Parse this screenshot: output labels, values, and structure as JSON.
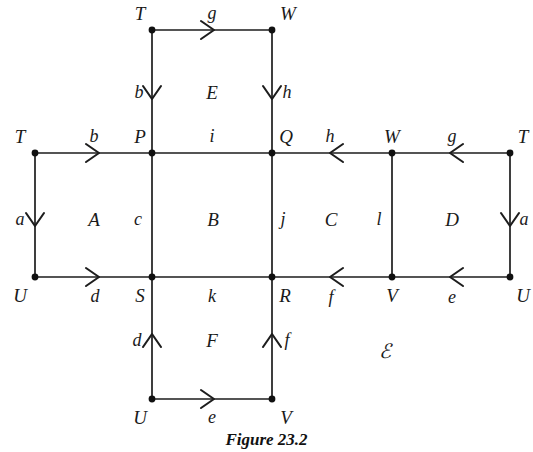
{
  "figure": {
    "caption": "Figure 23.2",
    "complex_label": "ℬ",
    "complex_label_display": "ℰ",
    "space_symbol": "X"
  },
  "style": {
    "line_color": "#1d1d1d",
    "node_color": "#111111",
    "text_color": "#1a1a1a",
    "background": "#ffffff"
  },
  "chart_data": {
    "type": "diagram",
    "title": "Figure 23.2",
    "vertices": [
      {
        "id": "v_T_top",
        "label": "T",
        "x": 152,
        "y": 30,
        "label_x": 140,
        "label_y": 13
      },
      {
        "id": "v_W_top",
        "label": "W",
        "x": 272,
        "y": 30,
        "label_x": 288,
        "label_y": 13
      },
      {
        "id": "v_T_left",
        "label": "T",
        "x": 35,
        "y": 153,
        "label_x": 20,
        "label_y": 136
      },
      {
        "id": "v_P",
        "label": "P",
        "x": 152,
        "y": 153,
        "label_x": 140,
        "label_y": 136
      },
      {
        "id": "v_Q",
        "label": "Q",
        "x": 272,
        "y": 153,
        "label_x": 286,
        "label_y": 136
      },
      {
        "id": "v_W_right",
        "label": "W",
        "x": 392,
        "y": 153,
        "label_x": 392,
        "label_y": 136
      },
      {
        "id": "v_T_right",
        "label": "T",
        "x": 510,
        "y": 153,
        "label_x": 523,
        "label_y": 136
      },
      {
        "id": "v_U_left",
        "label": "U",
        "x": 35,
        "y": 277,
        "label_x": 20,
        "label_y": 295
      },
      {
        "id": "v_S",
        "label": "S",
        "x": 152,
        "y": 277,
        "label_x": 140,
        "label_y": 295
      },
      {
        "id": "v_R",
        "label": "R",
        "x": 272,
        "y": 277,
        "label_x": 285,
        "label_y": 295
      },
      {
        "id": "v_V_right",
        "label": "V",
        "x": 392,
        "y": 277,
        "label_x": 392,
        "label_y": 295
      },
      {
        "id": "v_U_right",
        "label": "U",
        "x": 510,
        "y": 277,
        "label_x": 523,
        "label_y": 295
      },
      {
        "id": "v_U_bot",
        "label": "U",
        "x": 152,
        "y": 399,
        "label_x": 140,
        "label_y": 417
      },
      {
        "id": "v_V_bot",
        "label": "V",
        "x": 272,
        "y": 399,
        "label_x": 286,
        "label_y": 417
      }
    ],
    "edges": [
      {
        "id": "e_g_top",
        "label": "g",
        "from": "v_T_top",
        "to": "v_W_top",
        "direction": "right",
        "arrow": true,
        "label_x": 212,
        "label_y": 13,
        "arrow_x": 212,
        "arrow_y": 30
      },
      {
        "id": "e_b_top",
        "label": "b",
        "from": "v_T_top",
        "to": "v_P",
        "direction": "down",
        "arrow": true,
        "label_x": 139,
        "label_y": 92,
        "arrow_x": 152,
        "arrow_y": 97
      },
      {
        "id": "e_h_top",
        "label": "h",
        "from": "v_W_top",
        "to": "v_Q",
        "direction": "down",
        "arrow": true,
        "label_x": 287,
        "label_y": 92,
        "arrow_x": 272,
        "arrow_y": 97
      },
      {
        "id": "e_b_mid",
        "label": "b",
        "from": "v_T_left",
        "to": "v_P",
        "direction": "right",
        "arrow": true,
        "label_x": 94,
        "label_y": 136,
        "arrow_x": 97,
        "arrow_y": 153
      },
      {
        "id": "e_i",
        "label": "i",
        "from": "v_P",
        "to": "v_Q",
        "direction": "none",
        "arrow": false,
        "label_x": 212,
        "label_y": 136
      },
      {
        "id": "e_h_mid",
        "label": "h",
        "from": "v_W_right",
        "to": "v_Q",
        "direction": "left",
        "arrow": true,
        "label_x": 330,
        "label_y": 136,
        "arrow_x": 332,
        "arrow_y": 153
      },
      {
        "id": "e_g_mid",
        "label": "g",
        "from": "v_T_right",
        "to": "v_W_right",
        "direction": "left",
        "arrow": true,
        "label_x": 452,
        "label_y": 136,
        "arrow_x": 452,
        "arrow_y": 153
      },
      {
        "id": "e_a_left",
        "label": "a",
        "from": "v_T_left",
        "to": "v_U_left",
        "direction": "down",
        "arrow": true,
        "label_x": 20,
        "label_y": 219,
        "arrow_x": 35,
        "arrow_y": 224
      },
      {
        "id": "e_c",
        "label": "c",
        "from": "v_P",
        "to": "v_S",
        "direction": "none",
        "arrow": false,
        "label_x": 138,
        "label_y": 219
      },
      {
        "id": "e_j",
        "label": "j",
        "from": "v_Q",
        "to": "v_R",
        "direction": "none",
        "arrow": false,
        "label_x": 283,
        "label_y": 219
      },
      {
        "id": "e_l",
        "label": "l",
        "from": "v_W_right",
        "to": "v_V_right",
        "direction": "none",
        "arrow": false,
        "label_x": 379,
        "label_y": 219
      },
      {
        "id": "e_a_right",
        "label": "a",
        "from": "v_T_right",
        "to": "v_U_right",
        "direction": "down",
        "arrow": true,
        "label_x": 524,
        "label_y": 219,
        "arrow_x": 510,
        "arrow_y": 224
      },
      {
        "id": "e_d_mid",
        "label": "d",
        "from": "v_U_left",
        "to": "v_S",
        "direction": "right",
        "arrow": true,
        "label_x": 95,
        "label_y": 296,
        "arrow_x": 97,
        "arrow_y": 277
      },
      {
        "id": "e_k",
        "label": "k",
        "from": "v_S",
        "to": "v_R",
        "direction": "none",
        "arrow": false,
        "label_x": 212,
        "label_y": 296
      },
      {
        "id": "e_f_mid",
        "label": "f",
        "from": "v_V_right",
        "to": "v_R",
        "direction": "left",
        "arrow": true,
        "label_x": 331,
        "label_y": 297,
        "arrow_x": 332,
        "arrow_y": 277
      },
      {
        "id": "e_e_mid",
        "label": "e",
        "from": "v_U_right",
        "to": "v_V_right",
        "direction": "left",
        "arrow": true,
        "label_x": 452,
        "label_y": 297,
        "arrow_x": 452,
        "arrow_y": 277
      },
      {
        "id": "e_d_bot",
        "label": "d",
        "from": "v_U_bot",
        "to": "v_S",
        "direction": "up",
        "arrow": true,
        "label_x": 137,
        "label_y": 340,
        "arrow_x": 152,
        "arrow_y": 336
      },
      {
        "id": "e_f_bot",
        "label": "f",
        "from": "v_V_bot",
        "to": "v_R",
        "direction": "up",
        "arrow": true,
        "label_x": 287,
        "label_y": 340,
        "arrow_x": 272,
        "arrow_y": 336
      },
      {
        "id": "e_e_bot",
        "label": "e",
        "from": "v_U_bot",
        "to": "v_V_bot",
        "direction": "right",
        "arrow": true,
        "label_x": 212,
        "label_y": 417,
        "arrow_x": 212,
        "arrow_y": 399
      }
    ],
    "faces": [
      {
        "id": "face_E",
        "label": "E",
        "x": 212,
        "y": 92
      },
      {
        "id": "face_A",
        "label": "A",
        "x": 94,
        "y": 219
      },
      {
        "id": "face_B",
        "label": "B",
        "x": 213,
        "y": 219
      },
      {
        "id": "face_C",
        "label": "C",
        "x": 331,
        "y": 219
      },
      {
        "id": "face_D",
        "label": "D",
        "x": 452,
        "y": 219
      },
      {
        "id": "face_F",
        "label": "F",
        "x": 212,
        "y": 340
      }
    ],
    "annotations": [
      {
        "id": "ann_X",
        "label": "ℰ",
        "x": 385,
        "y": 351,
        "kind": "script-letter"
      }
    ]
  }
}
